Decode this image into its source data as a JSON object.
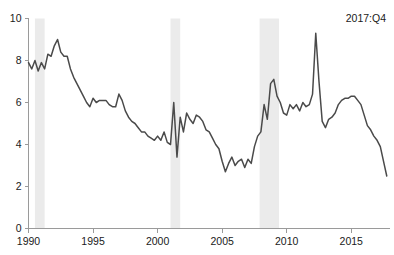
{
  "chart_data": {
    "type": "line",
    "title": "",
    "xlabel": "",
    "ylabel": "",
    "xlim": [
      1990.0,
      2018.0
    ],
    "ylim": [
      0,
      10
    ],
    "grid": false,
    "legend": null,
    "annotations": [
      {
        "text": "2017:Q4",
        "position": "top-right"
      }
    ],
    "y_ticks": [
      0,
      2,
      4,
      6,
      8,
      10
    ],
    "y_tick_labels": [
      "0",
      "2",
      "4",
      "6",
      "8",
      "10"
    ],
    "x_ticks": [
      1990,
      1995,
      2000,
      2005,
      2010,
      2015
    ],
    "x_tick_labels": [
      "1990",
      "1995",
      "2000",
      "2005",
      "2010",
      "2015"
    ],
    "series": [
      {
        "name": "rate",
        "color": "#4a4a4a",
        "x": [
          1990.0,
          1990.25,
          1990.5,
          1990.75,
          1991.0,
          1991.25,
          1991.5,
          1991.75,
          1992.0,
          1992.25,
          1992.5,
          1992.75,
          1993.0,
          1993.25,
          1993.5,
          1993.75,
          1994.0,
          1994.25,
          1994.5,
          1994.75,
          1995.0,
          1995.25,
          1995.5,
          1995.75,
          1996.0,
          1996.25,
          1996.5,
          1996.75,
          1997.0,
          1997.25,
          1997.5,
          1997.75,
          1998.0,
          1998.25,
          1998.5,
          1998.75,
          1999.0,
          1999.25,
          1999.5,
          1999.75,
          2000.0,
          2000.25,
          2000.5,
          2000.75,
          2001.0,
          2001.25,
          2001.5,
          2001.75,
          2002.0,
          2002.25,
          2002.5,
          2002.75,
          2003.0,
          2003.25,
          2003.5,
          2003.75,
          2004.0,
          2004.25,
          2004.5,
          2004.75,
          2005.0,
          2005.25,
          2005.5,
          2005.75,
          2006.0,
          2006.25,
          2006.5,
          2006.75,
          2007.0,
          2007.25,
          2007.5,
          2007.75,
          2008.0,
          2008.25,
          2008.5,
          2008.75,
          2009.0,
          2009.25,
          2009.5,
          2009.75,
          2010.0,
          2010.25,
          2010.5,
          2010.75,
          2011.0,
          2011.25,
          2011.5,
          2011.75,
          2012.0,
          2012.25,
          2012.5,
          2012.75,
          2013.0,
          2013.25,
          2013.5,
          2013.75,
          2014.0,
          2014.25,
          2014.5,
          2014.75,
          2015.0,
          2015.25,
          2015.5,
          2015.75,
          2016.0,
          2016.25,
          2016.5,
          2016.75,
          2017.0,
          2017.25,
          2017.5,
          2017.75
        ],
        "values": [
          7.9,
          7.6,
          8.0,
          7.5,
          7.9,
          7.6,
          8.3,
          8.2,
          8.7,
          9.0,
          8.4,
          8.2,
          8.2,
          7.6,
          7.2,
          6.9,
          6.6,
          6.3,
          6.0,
          5.8,
          6.2,
          6.0,
          6.1,
          6.1,
          6.1,
          5.9,
          5.8,
          5.8,
          6.4,
          6.1,
          5.6,
          5.3,
          5.1,
          5.0,
          4.8,
          4.6,
          4.6,
          4.4,
          4.3,
          4.2,
          4.4,
          4.2,
          4.6,
          4.1,
          4.0,
          6.0,
          3.4,
          5.3,
          4.6,
          5.5,
          5.2,
          5.0,
          5.4,
          5.3,
          5.1,
          4.7,
          4.6,
          4.3,
          4.0,
          3.8,
          3.2,
          2.7,
          3.1,
          3.4,
          3.0,
          3.2,
          3.3,
          2.9,
          3.3,
          3.1,
          3.9,
          4.4,
          4.6,
          5.9,
          5.2,
          6.9,
          7.1,
          6.3,
          6.0,
          5.5,
          5.4,
          5.9,
          5.7,
          5.9,
          5.6,
          6.0,
          5.8,
          5.9,
          6.4,
          9.3,
          7.0,
          5.1,
          4.8,
          5.2,
          5.3,
          5.5,
          5.9,
          6.1,
          6.2,
          6.2,
          6.3,
          6.3,
          6.1,
          5.9,
          5.4,
          4.9,
          4.7,
          4.4,
          4.2,
          3.9,
          3.2,
          2.5
        ]
      }
    ],
    "recession_bands": [
      {
        "start": 1990.5,
        "end": 1991.25,
        "label": "1990-91 recession"
      },
      {
        "start": 2001.0,
        "end": 2001.75,
        "label": "2001 recession"
      },
      {
        "start": 2007.9,
        "end": 2009.4,
        "label": "2007-09 recession"
      }
    ]
  }
}
